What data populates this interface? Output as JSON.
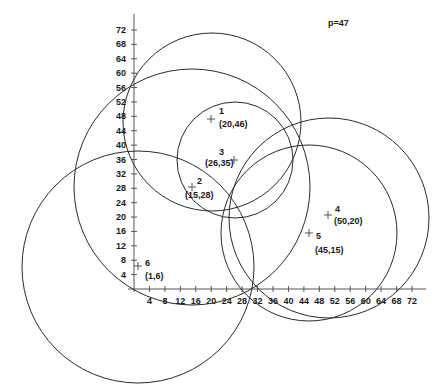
{
  "annotation": {
    "p_label": "p=47"
  },
  "axes": {
    "x_ticks": [
      "4",
      "8",
      "12",
      "16",
      "20",
      "24",
      "28",
      "32",
      "36",
      "40",
      "44",
      "48",
      "52",
      "56",
      "60",
      "64",
      "68",
      "72"
    ],
    "y_ticks": [
      "4",
      "8",
      "12",
      "16",
      "20",
      "24",
      "28",
      "32",
      "36",
      "40",
      "44",
      "48",
      "52",
      "56",
      "60",
      "64",
      "68",
      "72"
    ]
  },
  "points": [
    {
      "id": "1",
      "coord": "(20,46)"
    },
    {
      "id": "2",
      "coord": "(15,28)"
    },
    {
      "id": "3",
      "coord": "(26,35)"
    },
    {
      "id": "4",
      "coord": "(50,20)"
    },
    {
      "id": "5",
      "coord": "(45,15)"
    },
    {
      "id": "6",
      "coord": "(1,6)"
    }
  ],
  "chart_data": {
    "type": "scatter",
    "title": "",
    "annotation": "p=47",
    "xlabel": "",
    "ylabel": "",
    "xlim": [
      0,
      72
    ],
    "ylim": [
      0,
      72
    ],
    "x_ticks": [
      4,
      8,
      12,
      16,
      20,
      24,
      28,
      32,
      36,
      40,
      44,
      48,
      52,
      56,
      60,
      64,
      68,
      72
    ],
    "y_ticks": [
      4,
      8,
      12,
      16,
      20,
      24,
      28,
      32,
      36,
      40,
      44,
      48,
      52,
      56,
      60,
      64,
      68,
      72
    ],
    "points": [
      {
        "label": "1",
        "x": 20,
        "y": 46
      },
      {
        "label": "2",
        "x": 15,
        "y": 28
      },
      {
        "label": "3",
        "x": 26,
        "y": 35
      },
      {
        "label": "4",
        "x": 50,
        "y": 20
      },
      {
        "label": "5",
        "x": 45,
        "y": 15
      },
      {
        "label": "6",
        "x": 1,
        "y": 6
      }
    ],
    "circles": [
      {
        "center": "1",
        "radius_units": 23
      },
      {
        "center": "2",
        "radius_units": 31
      },
      {
        "center": "3",
        "radius_units": 15
      },
      {
        "center": "4",
        "radius_units": 26
      },
      {
        "center": "5",
        "radius_units": 24
      },
      {
        "center": "6",
        "radius_units": 31
      }
    ]
  }
}
